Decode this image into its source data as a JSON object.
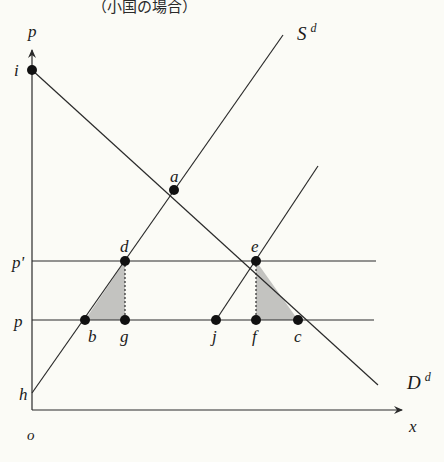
{
  "title": "（小国の場合）",
  "axes": {
    "y_label": "p",
    "x_label": "x",
    "origin_label": "o"
  },
  "price_levels": {
    "world_price_with_tariff": "p'",
    "world_price": "p"
  },
  "curves": {
    "supply": {
      "label": "S",
      "superscript": "d"
    },
    "demand": {
      "label": "D",
      "superscript": "d"
    }
  },
  "points": {
    "i": "i",
    "a": "a",
    "d": "d",
    "e": "e",
    "b": "b",
    "g": "g",
    "j": "j",
    "f": "f",
    "c": "c",
    "h": "h"
  },
  "colors": {
    "background": "#fbfbf6",
    "ink": "#2a2a2a",
    "shade": "#b9b9b6"
  }
}
